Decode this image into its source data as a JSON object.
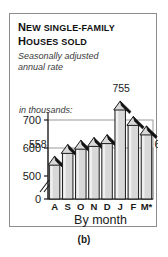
{
  "figure": {
    "caption": "(b)",
    "title_lines": [
      {
        "lead": "N",
        "rest": "EW SINGLE-FAMILY"
      },
      {
        "lead": "H",
        "rest": "OUSES SOLD"
      }
    ],
    "subtitle_lines": [
      "Seasonally adjusted",
      "annual rate"
    ],
    "units_label": "in thousands:"
  },
  "chart_data": {
    "type": "bar",
    "title": "New single-family houses sold",
    "subtitle": "Seasonally adjusted annual rate",
    "xlabel": "By month",
    "ylabel": "in thousands:",
    "categories": [
      "A",
      "S",
      "O",
      "N",
      "D",
      "J",
      "F",
      "M*"
    ],
    "values": [
      558,
      600,
      615,
      625,
      635,
      755,
      700,
      666
    ],
    "data_labels": [
      {
        "category": "A",
        "value": 558,
        "text": "558",
        "shown": true
      },
      {
        "category": "S",
        "value": 600,
        "text": "",
        "shown": false
      },
      {
        "category": "O",
        "value": 615,
        "text": "",
        "shown": false
      },
      {
        "category": "N",
        "value": 625,
        "text": "",
        "shown": false
      },
      {
        "category": "D",
        "value": 635,
        "text": "",
        "shown": false
      },
      {
        "category": "J",
        "value": 755,
        "text": "755",
        "shown": true
      },
      {
        "category": "F",
        "value": 700,
        "text": "",
        "shown": false
      },
      {
        "category": "M*",
        "value": 666,
        "text": "666",
        "shown": true
      }
    ],
    "yticks": [
      "700",
      "600",
      "500",
      "0"
    ],
    "ytick_values": [
      700,
      600,
      500,
      0
    ],
    "ylim": [
      470,
      780
    ],
    "axis_break": true,
    "grid": true,
    "gridlines": [
      700,
      600
    ],
    "legend": "none",
    "bar_style": "arrow-roof-top",
    "colors": {
      "bar_fill": "#d8d8d8",
      "bar_edge": "#1a1a1a",
      "arrow_dark": "#111111",
      "grid": "#9a9a9a",
      "axis": "#1a1a1a",
      "panel_border": "#8d8d8d",
      "text": "#1a1a1a",
      "subtitle_text": "#3a3a3a",
      "background": "#ffffff"
    }
  },
  "axis": {
    "x_title": "By month",
    "months": [
      "A",
      "S",
      "O",
      "N",
      "D",
      "J",
      "F",
      "M*"
    ],
    "y_labels": [
      "700",
      "600",
      "500",
      "0"
    ]
  }
}
